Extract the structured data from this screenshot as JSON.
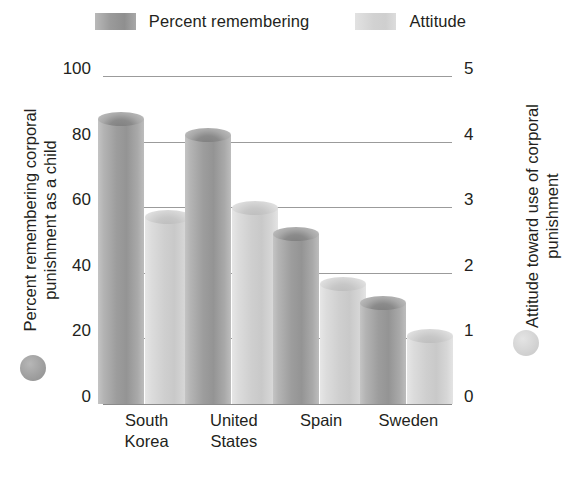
{
  "legend": {
    "items": [
      {
        "label": "Percent remembering",
        "swatch": "dark-gray-swatch",
        "color": "#9a9a9a"
      },
      {
        "label": "Attitude",
        "swatch": "light-gray-swatch",
        "color": "#d2d2d2"
      }
    ]
  },
  "axes": {
    "left": {
      "title": "Percent remembering corporal punishment as a child",
      "ticks": [
        "100",
        "80",
        "60",
        "40",
        "20",
        "0"
      ],
      "marker_color": "#a0a0a0"
    },
    "right": {
      "title": "Attitude toward use of corporal punishment",
      "ticks": [
        "5",
        "4",
        "3",
        "2",
        "1",
        "0"
      ],
      "marker_color": "#d4d4d4"
    }
  },
  "categories_display": [
    {
      "line1": "South",
      "line2": "Korea"
    },
    {
      "line1": "United",
      "line2": "States"
    },
    {
      "line1": "Spain",
      "line2": ""
    },
    {
      "line1": "Sweden",
      "line2": ""
    }
  ],
  "chart_data": {
    "type": "bar",
    "title": "",
    "categories": [
      "South Korea",
      "United States",
      "Spain",
      "Sweden"
    ],
    "series": [
      {
        "name": "Percent remembering",
        "axis": "left",
        "values": [
          89,
          84,
          54,
          33
        ],
        "color": "#9a9a9a"
      },
      {
        "name": "Attitude",
        "axis": "right",
        "values": [
          2.95,
          3.1,
          1.93,
          1.15
        ],
        "color": "#d2d2d2"
      }
    ],
    "xlabel": "",
    "ylabel": "Percent remembering corporal punishment as a child",
    "y2label": "Attitude toward use of corporal punishment",
    "ylim": [
      0,
      100
    ],
    "y2lim": [
      0,
      5
    ],
    "yticks": [
      0,
      20,
      40,
      60,
      80,
      100
    ],
    "y2ticks": [
      0,
      1,
      2,
      3,
      4,
      5
    ],
    "grid": true,
    "legend_position": "top"
  }
}
